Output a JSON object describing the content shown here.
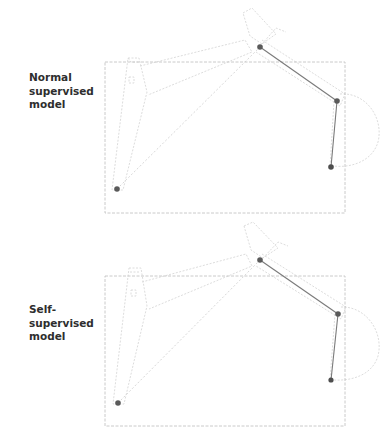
{
  "figure": {
    "panels": [
      {
        "label": "Normal\nsupervised\nmodel",
        "bbox": {
          "x": 105,
          "y": 62,
          "w": 240,
          "h": 151
        },
        "keypoints": [
          {
            "name": "base",
            "x": 117,
            "y": 189
          },
          {
            "name": "joint-top",
            "x": 260,
            "y": 47
          },
          {
            "name": "joint-right",
            "x": 337,
            "y": 101
          },
          {
            "name": "tip",
            "x": 331,
            "y": 167
          }
        ]
      },
      {
        "label": "Self-\nsupervised\nmodel",
        "bbox": {
          "x": 105,
          "y": 276,
          "w": 240,
          "h": 150
        },
        "keypoints": [
          {
            "name": "base",
            "x": 118,
            "y": 403
          },
          {
            "name": "joint-top",
            "x": 260,
            "y": 260
          },
          {
            "name": "joint-right",
            "x": 338,
            "y": 314
          },
          {
            "name": "tip",
            "x": 331,
            "y": 380
          }
        ]
      }
    ],
    "colors": {
      "keypoint": "#555555",
      "bone": "#777777",
      "outline": "#cfcfcf",
      "bbox": "#bdbdbd",
      "label": "#2e2e2e"
    }
  }
}
